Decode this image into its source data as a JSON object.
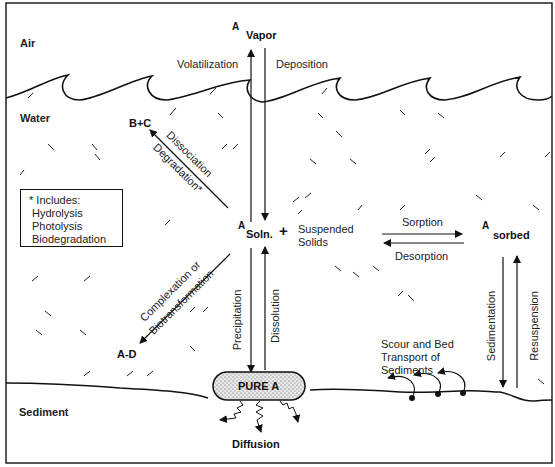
{
  "diagram": {
    "zones": {
      "air": "Air",
      "water": "Water",
      "sediment": "Sediment"
    },
    "species": {
      "a_superscript": "A",
      "vapor": "Vapor",
      "soln": "Soln.",
      "plus": "+",
      "suspended_line1": "Suspended",
      "suspended_line2": "Solids",
      "sorbed": "sorbed",
      "b_plus_c": "B+C",
      "a_d": "A-D",
      "pure_a": "PURE A",
      "diffusion": "Diffusion"
    },
    "processes": {
      "volatilization": "Volatilization",
      "deposition": "Deposition",
      "dissociation": "Dissociation",
      "degradation": "Degradation*",
      "complexation": "Complexation or",
      "biotransformation": "Biotransformation",
      "sorption": "Sorption",
      "desorption": "Desorption",
      "precipitation": "Precipitation",
      "dissolution": "Dissolution",
      "sedimentation": "Sedimentation",
      "resuspension": "Resuspension",
      "scour_line1": "Scour and Bed",
      "scour_line2": "Transport of",
      "scour_line3": "Sediments"
    },
    "note_box": {
      "title": "* Includes:",
      "items": [
        "Hydrolysis",
        "Photolysis",
        "Biodegradation"
      ]
    }
  }
}
